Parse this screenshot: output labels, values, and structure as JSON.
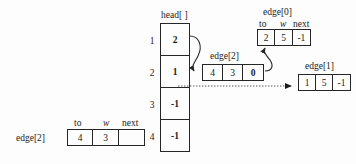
{
  "diagram": {
    "title_text": "",
    "colors": {
      "stroke": "#262626",
      "background": "#fdfdfd",
      "text": "#1a1a1a"
    },
    "head_array": {
      "label": "head[ ]",
      "row_labels": [
        "1",
        "2",
        "3",
        "4"
      ],
      "values": [
        "2",
        "1",
        "-1",
        "-1"
      ]
    },
    "column_headers": {
      "to": "to",
      "w": "w",
      "next": "next"
    },
    "records": {
      "edge0": {
        "label": "edge[0]",
        "to": "2",
        "w": "5",
        "next": "-1"
      },
      "edge1": {
        "label": "edge[1]",
        "to": "1",
        "w": "5",
        "next": "-1"
      },
      "edge2_middle": {
        "label": "edge[2]",
        "to": "4",
        "w": "3",
        "next": "0"
      },
      "edge2_bottomleft": {
        "label": "edge[2]",
        "to": "4",
        "w": "3",
        "next": ""
      }
    },
    "connectors": [
      {
        "name": "head1-to-edge2",
        "style": "solid-curved-arrow"
      },
      {
        "name": "edge2-next-to-edge0",
        "style": "solid-curved-arrow"
      },
      {
        "name": "head2-to-edge1",
        "style": "dotted-arrow"
      }
    ]
  }
}
